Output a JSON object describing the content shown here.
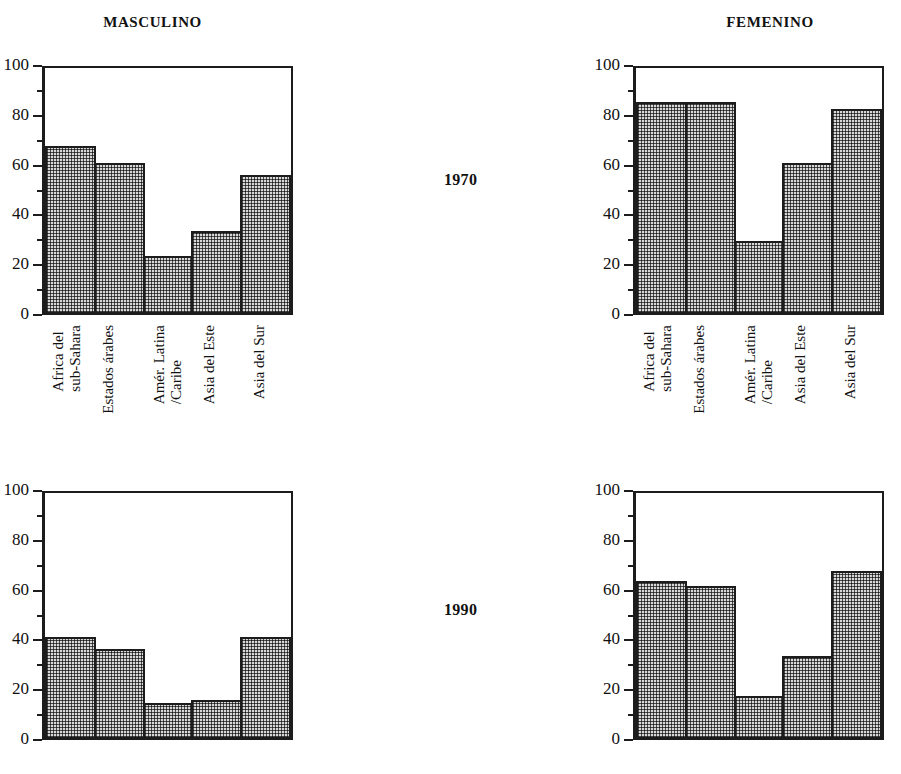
{
  "panels": {
    "masculino_title": "MASCULINO",
    "femenino_title": "FEMENINO",
    "year_1970": "1970",
    "year_1990": "1990"
  },
  "axis": {
    "ticks": [
      "0",
      "20",
      "40",
      "60",
      "80",
      "100"
    ],
    "minor_ticks": [
      "10",
      "30",
      "50",
      "70",
      "90"
    ],
    "min": 0,
    "max": 100
  },
  "categories": [
    "Africa del\nsub-Sahara",
    "Estados árabes",
    "Amér. Latina\n/Caribe",
    "Asia del Este",
    "Asia del Sur"
  ],
  "colors": {
    "bar_fill": "#d8d8d8",
    "bar_border": "#1c1c1c",
    "axis": "#1c1c1c",
    "text": "#111111",
    "background": "#ffffff"
  },
  "chart_data": [
    {
      "type": "bar",
      "title": "MASCULINO",
      "subtitle": "1970",
      "xlabel": "",
      "ylabel": "",
      "ylim": [
        0,
        100
      ],
      "grid": false,
      "legend": "none",
      "categories": [
        "Africa del sub-Sahara",
        "Estados árabes",
        "Amér. Latina /Caribe",
        "Asia del Este",
        "Asia del Sur"
      ],
      "values": [
        68,
        61,
        23,
        33,
        56
      ]
    },
    {
      "type": "bar",
      "title": "FEMENINO",
      "subtitle": "1970",
      "xlabel": "",
      "ylabel": "",
      "ylim": [
        0,
        100
      ],
      "grid": false,
      "legend": "none",
      "categories": [
        "Africa del sub-Sahara",
        "Estados árabes",
        "Amér. Latina /Caribe",
        "Asia del Este",
        "Asia del Sur"
      ],
      "values": [
        86,
        86,
        29,
        61,
        83
      ]
    },
    {
      "type": "bar",
      "title": "MASCULINO",
      "subtitle": "1990",
      "xlabel": "",
      "ylabel": "",
      "ylim": [
        0,
        100
      ],
      "grid": false,
      "legend": "none",
      "categories": [
        "Africa del sub-Sahara",
        "Estados árabes",
        "Amér. Latina /Caribe",
        "Asia del Este",
        "Asia del Sur"
      ],
      "values": [
        41,
        36,
        14,
        15,
        41
      ]
    },
    {
      "type": "bar",
      "title": "FEMENINO",
      "subtitle": "1990",
      "xlabel": "",
      "ylabel": "",
      "ylim": [
        0,
        100
      ],
      "grid": false,
      "legend": "none",
      "categories": [
        "Africa del sub-Sahara",
        "Estados árabes",
        "Amér. Latina /Caribe",
        "Asia del Este",
        "Asia del Sur"
      ],
      "values": [
        64,
        62,
        17,
        33,
        68
      ]
    }
  ]
}
